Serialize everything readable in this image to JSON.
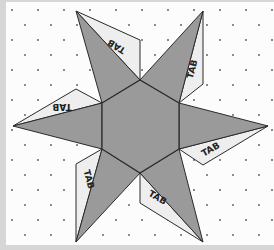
{
  "diagram": {
    "colors": {
      "background": "#fcfcfc",
      "frame": "#d6d6d6",
      "face_fill": "#9a9a9a",
      "tab_fill": "#eeeeee",
      "line": "#2a2a2a",
      "dot": "#555555"
    },
    "hexagon": [
      [
        140,
        80
      ],
      [
        179,
        103
      ],
      [
        179,
        149
      ],
      [
        140,
        173
      ],
      [
        102,
        149
      ],
      [
        102,
        103
      ]
    ],
    "points": [
      {
        "name": "top-left",
        "poly": [
          [
            76,
            11
          ],
          [
            140,
            80
          ],
          [
            102,
            103
          ]
        ]
      },
      {
        "name": "top-right",
        "poly": [
          [
            203,
            11
          ],
          [
            179,
            103
          ],
          [
            140,
            80
          ]
        ]
      },
      {
        "name": "right",
        "poly": [
          [
            268,
            126
          ],
          [
            179,
            149
          ],
          [
            179,
            103
          ]
        ]
      },
      {
        "name": "bottom-right",
        "poly": [
          [
            203,
            242
          ],
          [
            140,
            173
          ],
          [
            179,
            149
          ]
        ]
      },
      {
        "name": "bottom-left",
        "poly": [
          [
            76,
            242
          ],
          [
            102,
            149
          ],
          [
            140,
            173
          ]
        ]
      },
      {
        "name": "left",
        "poly": [
          [
            13,
            126
          ],
          [
            102,
            103
          ],
          [
            102,
            149
          ]
        ]
      }
    ],
    "tabs": [
      {
        "label": "TAB",
        "poly": [
          [
            76,
            11
          ],
          [
            140,
            40
          ],
          [
            140,
            80
          ]
        ],
        "text_x": 118,
        "text_y": 44,
        "rotate": 212
      },
      {
        "label": "TAB",
        "poly": [
          [
            13,
            126
          ],
          [
            76,
            89
          ],
          [
            102,
            103
          ]
        ],
        "text_x": 62,
        "text_y": 104,
        "rotate": 180
      },
      {
        "label": "TAB",
        "poly": [
          [
            203,
            11
          ],
          [
            203,
            84
          ],
          [
            179,
            103
          ]
        ],
        "text_x": 195,
        "text_y": 70,
        "rotate": -75
      },
      {
        "label": "TAB",
        "poly": [
          [
            268,
            126
          ],
          [
            203,
            165
          ],
          [
            179,
            149
          ]
        ],
        "text_x": 212,
        "text_y": 152,
        "rotate": -30
      },
      {
        "label": "TAB",
        "poly": [
          [
            140,
            173
          ],
          [
            140,
            203
          ],
          [
            203,
            242
          ]
        ],
        "text_x": 156,
        "text_y": 200,
        "rotate": 30
      },
      {
        "label": "TAB",
        "poly": [
          [
            76,
            242
          ],
          [
            76,
            164
          ],
          [
            102,
            149
          ]
        ],
        "text_x": 86,
        "text_y": 180,
        "rotate": 75
      }
    ],
    "dot_grid": {
      "spacing_x": 26,
      "spacing_y": 15,
      "offset_x": 12,
      "offset_y": 4
    }
  }
}
